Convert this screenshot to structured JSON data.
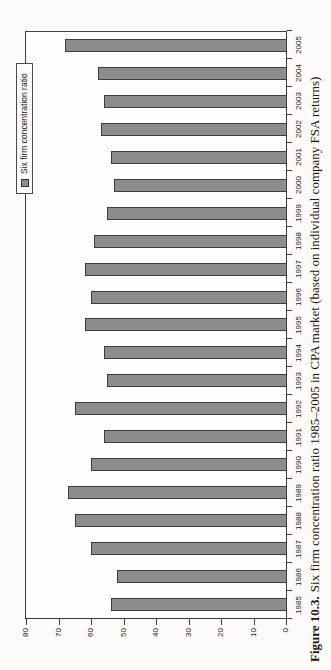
{
  "figure_caption": {
    "label": "Figure 10.3.",
    "text": "Six firm concentration ratio 1985–2005 in CPA market (based on individual company FSA returns)"
  },
  "chart_data": {
    "type": "bar",
    "title": "",
    "legend": "Six firm concentration ratio",
    "legend_position": "top-right, box straddling plot border",
    "orientation": "column chart rotated 90° counter-clockwise on the printed page",
    "categories": [
      "1985",
      "1986",
      "1987",
      "1988",
      "1989",
      "1990",
      "1991",
      "1992",
      "1993",
      "1994",
      "1995",
      "1996",
      "1997",
      "1998",
      "1999",
      "2000",
      "2001",
      "2002",
      "2003",
      "2004",
      "2005"
    ],
    "values": [
      54,
      52,
      60,
      65,
      67,
      60,
      56,
      65,
      55,
      56,
      62,
      60,
      62,
      59,
      55,
      53,
      54,
      57,
      56,
      58,
      68
    ],
    "xlabel": "",
    "ylabel": "",
    "ylim": [
      0,
      80
    ],
    "ytick_step": 10,
    "grid": false,
    "bar_color": "#8c8c8c",
    "bar_border_color": "#3d3d3d"
  }
}
